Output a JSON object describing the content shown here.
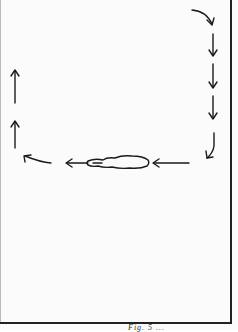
{
  "diagram": {
    "stroke_color": "#1a1a1a",
    "background_color": "#fbfbfb",
    "right_column_arrows": [
      {
        "type": "curved-arrow-down",
        "direction": "down-right"
      },
      {
        "type": "arrow-down",
        "direction": "down"
      },
      {
        "type": "arrow-down",
        "direction": "down"
      },
      {
        "type": "arrow-down",
        "direction": "down"
      },
      {
        "type": "curved-arrow-down-left",
        "direction": "down-left"
      }
    ],
    "middle_row_arrows": [
      {
        "type": "arrow-left",
        "direction": "left"
      },
      {
        "type": "arrow-left",
        "direction": "left"
      },
      {
        "type": "curved-arrow-up-left",
        "direction": "up-left"
      }
    ],
    "left_column_arrows": [
      {
        "type": "arrow-up",
        "direction": "up"
      },
      {
        "type": "arrow-up",
        "direction": "up"
      }
    ],
    "center_shape": "elongated-blob",
    "caption": "Fig. 5 ..."
  }
}
